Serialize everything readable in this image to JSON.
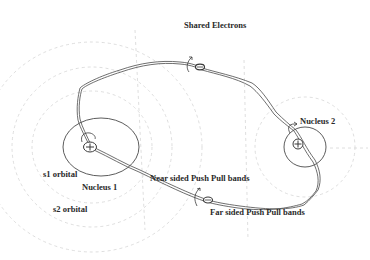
{
  "diagram": {
    "title": "Shared Electrons",
    "labels": {
      "shared_electrons": "Shared Electrons",
      "nucleus_1": "Nucleus 1",
      "nucleus_2": "Nucleus 2",
      "s1_orbital": "s1 orbital",
      "s2_orbital": "s2 orbital",
      "near_sided": "Near sided Push Pull bands",
      "far_sided": "Far sided Push Pull bands"
    },
    "symbols": {
      "nucleus_charge": "+",
      "electron_charge": "-"
    },
    "colors": {
      "line": "#4a4a4a",
      "faint": "#d8d8d8",
      "text": "#2a2a2a",
      "background": "#ffffff"
    }
  }
}
